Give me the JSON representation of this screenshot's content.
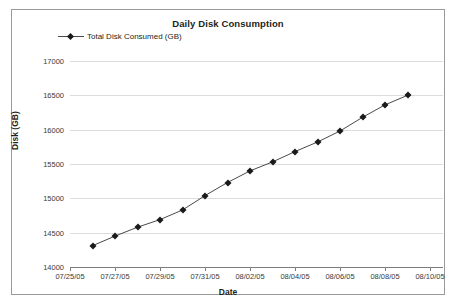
{
  "chart_data": {
    "type": "line",
    "title": "Daily Disk Consumption",
    "xlabel": "Date",
    "ylabel": "Disk (GB)",
    "legend": [
      "Total Disk Consumed (GB)"
    ],
    "legend_position": "top-left",
    "grid": true,
    "ylim": [
      14000,
      17000
    ],
    "ytick_step": 500,
    "yticks": [
      "14000",
      "14500",
      "15000",
      "15500",
      "16000",
      "16500",
      "17000"
    ],
    "xticks": [
      "07/25/05",
      "07/27/05",
      "07/29/05",
      "07/31/05",
      "08/02/05",
      "08/04/05",
      "08/06/05",
      "08/08/05",
      "08/10/05"
    ],
    "x": [
      "07/26/05",
      "07/27/05",
      "07/28/05",
      "07/29/05",
      "07/30/05",
      "07/31/05",
      "08/01/05",
      "08/02/05",
      "08/03/05",
      "08/04/05",
      "08/05/05",
      "08/06/05",
      "08/07/05",
      "08/08/05",
      "08/09/05"
    ],
    "series": [
      {
        "name": "Total Disk Consumed (GB)",
        "color": "#1a1a1a",
        "marker": "diamond",
        "values": [
          14310,
          14450,
          14580,
          14690,
          14830,
          15040,
          15230,
          15400,
          15530,
          15680,
          15820,
          15980,
          16180,
          16360,
          16500
        ]
      }
    ]
  },
  "colors": {
    "frame": "#9a9a9a",
    "grid": "#dcdcdc",
    "axis": "#7d7d7d",
    "line": "#4a4a4a",
    "marker": "#111111",
    "text": "#231f20"
  }
}
